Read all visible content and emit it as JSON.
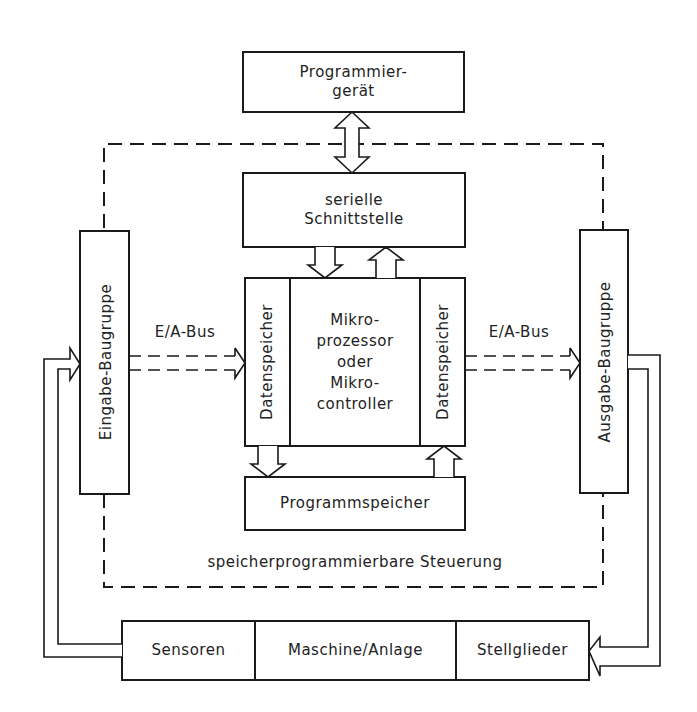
{
  "diagram": {
    "colors": {
      "line": "#1a1a1a",
      "background": "#ffffff"
    },
    "nodes": {
      "programmiergeraet": "Programmier-\ngerät",
      "serielle_schnittstelle": "serielle\nSchnittstelle",
      "mikroprozessor": "Mikro-\nprozessor\noder\nMikro-\ncontroller",
      "datenspeicher_left": "Datenspeicher",
      "datenspeicher_right": "Datenspeicher",
      "programmspeicher": "Programmspeicher",
      "eingabe_baugruppe": "Eingabe-Baugruppe",
      "ausgabe_baugruppe": "Ausgabe-Baugruppe",
      "sensoren": "Sensoren",
      "maschine_anlage": "Maschine/Anlage",
      "stellglieder": "Stellglieder"
    },
    "labels": {
      "bus_left": "E/A-Bus",
      "bus_right": "E/A-Bus",
      "sps_frame": "speicherprogrammierbare Steuerung"
    },
    "edges": [
      {
        "from": "Programmiergerät",
        "to": "serielle Schnittstelle",
        "type": "bidirectional"
      },
      {
        "from": "serielle Schnittstelle",
        "to": "Datenspeicher (links)",
        "type": "arrow"
      },
      {
        "from": "Datenspeicher (rechts)",
        "to": "serielle Schnittstelle",
        "type": "arrow"
      },
      {
        "from": "Datenspeicher (links)",
        "to": "Programmspeicher",
        "type": "arrow"
      },
      {
        "from": "Programmspeicher",
        "to": "Datenspeicher (rechts)",
        "type": "arrow"
      },
      {
        "from": "Eingabe-Baugruppe",
        "to": "Datenspeicher (links)",
        "type": "bus",
        "label": "E/A-Bus"
      },
      {
        "from": "Datenspeicher (rechts)",
        "to": "Ausgabe-Baugruppe",
        "type": "bus",
        "label": "E/A-Bus"
      },
      {
        "from": "Sensoren",
        "to": "Eingabe-Baugruppe",
        "type": "arrow"
      },
      {
        "from": "Ausgabe-Baugruppe",
        "to": "Stellglieder",
        "type": "arrow"
      }
    ]
  }
}
